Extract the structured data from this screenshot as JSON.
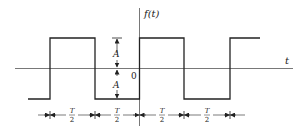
{
  "diagram": {
    "type": "square-wave",
    "y_axis_label": "f(t)",
    "x_axis_label": "t",
    "origin_label": "0",
    "amplitude_label_upper": "A",
    "amplitude_label_lower": "A",
    "half_period_labels": [
      {
        "num": "T",
        "den": "2"
      },
      {
        "num": "T",
        "den": "2"
      },
      {
        "num": "T",
        "den": "2"
      },
      {
        "num": "T",
        "den": "2"
      }
    ],
    "colors": {
      "line": "#222222",
      "axis": "#555555",
      "background": "#ffffff"
    }
  }
}
